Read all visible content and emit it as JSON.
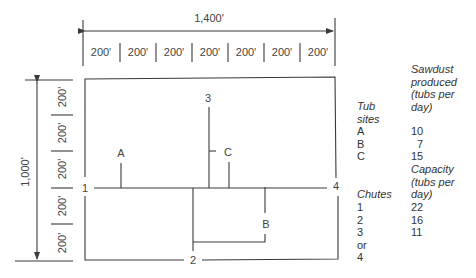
{
  "dimensions": {
    "width_total": "1,400'",
    "height_total": "1,000'",
    "width_segments": [
      "200'",
      "200'",
      "200'",
      "200'",
      "200'",
      "200'",
      "200'"
    ],
    "height_segments": [
      "200'",
      "200'",
      "200'",
      "200'",
      "200'"
    ]
  },
  "map": {
    "chute_labels": [
      "1",
      "2",
      "3",
      "4"
    ],
    "tub_site_labels": [
      "A",
      "B",
      "C"
    ]
  },
  "sawdust_table": {
    "header_col1": [
      "Tub",
      "sites"
    ],
    "header_col2": [
      "Sawdust",
      "produced",
      "(tubs per",
      "day)"
    ],
    "rows": [
      {
        "site": "A",
        "value": "10"
      },
      {
        "site": "B",
        "value": "7"
      },
      {
        "site": "C",
        "value": "15"
      }
    ]
  },
  "capacity_table": {
    "header_col1": [
      "Chutes"
    ],
    "header_col2": [
      "Capacity",
      "(tubs per",
      "day)"
    ],
    "rows": [
      {
        "chute": "1",
        "value": "22"
      },
      {
        "chute": "2",
        "value": "16"
      },
      {
        "chute": "3 or 4",
        "value": "11"
      }
    ]
  },
  "colors": {
    "line": "#3a3a3a",
    "text": "#444444"
  }
}
